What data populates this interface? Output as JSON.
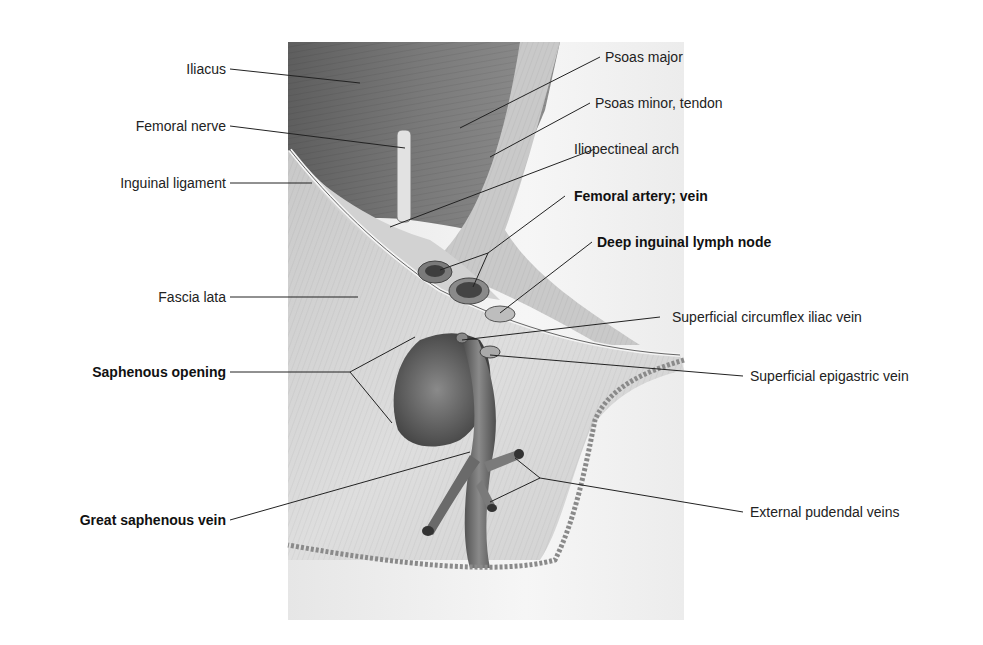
{
  "figure": {
    "labels_left": [
      {
        "id": "iliacus",
        "text": "Iliacus",
        "bold": false
      },
      {
        "id": "femoral-nerve",
        "text": "Femoral nerve",
        "bold": false
      },
      {
        "id": "inguinal-ligament",
        "text": "Inguinal ligament",
        "bold": false
      },
      {
        "id": "fascia-lata",
        "text": "Fascia lata",
        "bold": false
      },
      {
        "id": "saphenous-opening",
        "text": "Saphenous opening",
        "bold": true
      },
      {
        "id": "great-saphenous-vein",
        "text": "Great saphenous vein",
        "bold": true
      }
    ],
    "labels_right": [
      {
        "id": "psoas-major",
        "text": "Psoas major",
        "bold": false
      },
      {
        "id": "psoas-minor-tendon",
        "text": "Psoas minor, tendon",
        "bold": false
      },
      {
        "id": "iliopectineal-arch",
        "text": "Iliopectineal arch",
        "bold": false
      },
      {
        "id": "femoral-artery-vein",
        "text": "Femoral artery; vein",
        "bold": true
      },
      {
        "id": "deep-inguinal-lymph-node",
        "text": "Deep inguinal lymph node",
        "bold": true
      },
      {
        "id": "superficial-circumflex-iliac-vein",
        "text": "Superficial circumflex iliac vein",
        "bold": false
      },
      {
        "id": "superficial-epigastric-vein",
        "text": "Superficial epigastric vein",
        "bold": false
      },
      {
        "id": "external-pudendal-veins",
        "text": "External pudendal veins",
        "bold": false
      }
    ],
    "colors": {
      "muscle_dark": "#6e6e6e",
      "muscle_mid": "#9a9a9a",
      "fascia_light": "#d6d6d6",
      "skin": "#f0f0f0",
      "vein_dark": "#555555",
      "leader_line": "#222222",
      "text": "#222222"
    }
  }
}
